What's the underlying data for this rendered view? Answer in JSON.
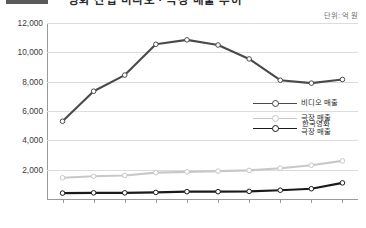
{
  "title": {
    "text": "영화 산업 비디오 · 극장 매출 추이",
    "swatch_color": "#5a5a5a"
  },
  "unit_label": "단위: 억 원",
  "colors": {
    "video_series": "#4a4a4a",
    "theater_series": "#c8c8c8",
    "korean_film_series": "#1a1a1a",
    "gridline": "#dcdcdc",
    "axis": "#9a9a9a",
    "background": "#ffffff",
    "text": "#2f2f2f"
  },
  "legend": {
    "position": "center-right",
    "items": [
      {
        "label": "비디오 매출",
        "color": "#4a4a4a",
        "line": 1
      },
      {
        "label": "극장 매출",
        "color": "#c8c8c8",
        "line": 1
      },
      {
        "label_line1": "한국영화",
        "label_line2": "극장 매출",
        "color": "#1a1a1a",
        "line": 2
      }
    ]
  },
  "chart_data": {
    "type": "line",
    "title": "영화 산업 비디오 · 극장 매출 추이",
    "xlabel": "",
    "ylabel": "",
    "unit": "억 원",
    "grid": true,
    "legend_position": "center-right",
    "x": [
      "1990",
      "1991",
      "1992",
      "1993",
      "1994",
      "1995",
      "1996",
      "1997",
      "1998",
      "1999"
    ],
    "ylim": [
      0,
      12000
    ],
    "yticks": [
      0,
      2000,
      4000,
      6000,
      8000,
      10000,
      12000
    ],
    "ytick_labels": [
      "",
      "2,000",
      "4,000",
      "6,000",
      "8,000",
      "10,000",
      "12,000"
    ],
    "series": [
      {
        "name": "비디오 매출",
        "color": "#4a4a4a",
        "marker": "circle",
        "values": [
          5300,
          7350,
          8450,
          10550,
          10850,
          10500,
          9550,
          8100,
          7900,
          8150
        ]
      },
      {
        "name": "극장 매출",
        "color": "#c8c8c8",
        "marker": "circle",
        "values": [
          1450,
          1550,
          1600,
          1800,
          1850,
          1900,
          1950,
          2100,
          2300,
          2600
        ]
      },
      {
        "name": "한국영화 극장 매출",
        "color": "#1a1a1a",
        "marker": "circle",
        "values": [
          400,
          420,
          420,
          450,
          500,
          500,
          520,
          600,
          700,
          1100
        ]
      }
    ]
  }
}
